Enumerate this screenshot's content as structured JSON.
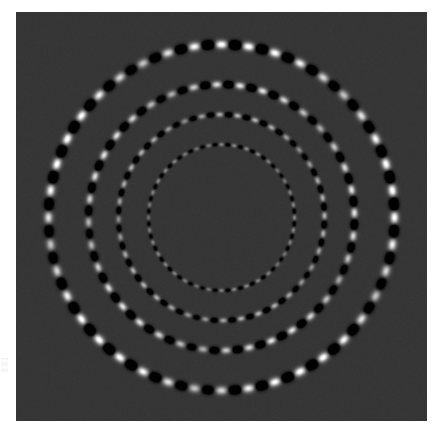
{
  "figure": {
    "title": "",
    "background_color": "#ffffff",
    "plot_background_color": "#363636",
    "plot_left": 16,
    "plot_top": 12,
    "plot_width": 411,
    "plot_height": 409
  },
  "chart_data": {
    "type": "scatter",
    "title": "",
    "subtitle": "",
    "xlabel": "",
    "ylabel": "",
    "grid": false,
    "legend": false,
    "colormap": "gray",
    "background_value": 0.21,
    "value_range": [
      0.0,
      1.0
    ],
    "center_x": 205.5,
    "center_y": 205.5,
    "xlim": [
      0,
      411
    ],
    "ylim": [
      0,
      409
    ],
    "series": [
      {
        "name": "ring-1-inner",
        "radius": 73,
        "lobe_count": 72,
        "lobe_length": 4.6,
        "lobe_width": 2.6,
        "amplitude": 0.34,
        "phase_deg": 0,
        "modulation_period_deg": 72,
        "modulation_depth": 0.55
      },
      {
        "name": "ring-2",
        "radius": 103,
        "lobe_count": 72,
        "lobe_length": 6.4,
        "lobe_width": 3.4,
        "amplitude": 0.52,
        "phase_deg": 9,
        "modulation_period_deg": 72,
        "modulation_depth": 0.6
      },
      {
        "name": "ring-3",
        "radius": 133,
        "lobe_count": 72,
        "lobe_length": 8.2,
        "lobe_width": 4.4,
        "amplitude": 0.72,
        "phase_deg": 18,
        "modulation_period_deg": 72,
        "modulation_depth": 0.65
      },
      {
        "name": "ring-4-outer",
        "radius": 173,
        "lobe_count": 80,
        "lobe_length": 10.2,
        "lobe_width": 5.4,
        "amplitude": 0.92,
        "phase_deg": 27,
        "modulation_period_deg": 72,
        "modulation_depth": 0.7
      }
    ],
    "x": [],
    "values": []
  }
}
